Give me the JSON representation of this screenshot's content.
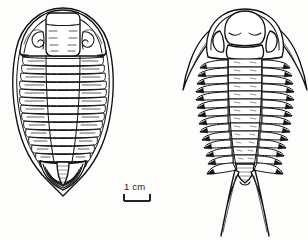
{
  "figure": {
    "kind": "scientific-line-drawing",
    "background_color": "#fdfdfc",
    "ink_color": "#1a1a1a",
    "width": 308,
    "height": 240
  },
  "scale_bar": {
    "label": "1 cm",
    "label_text": "1 cm",
    "bar_length_px": 26,
    "style": "bracket",
    "position": "center-bottom"
  },
  "specimens": [
    {
      "id": "left-specimen",
      "name": "smooth-trilobite",
      "position": "left",
      "outline": "ovate-teardrop",
      "cephalon": {
        "shape": "semicircular",
        "glabella": "elongate-subrectangular",
        "glabellar_furrows": 4,
        "eye_structure": "curved-palpebral-lobe",
        "genal_spines": "absent",
        "border_rim": "present"
      },
      "thorax": {
        "segment_count": 14,
        "pleural_tips": "rounded",
        "axial_lobe": "narrow-tapering"
      },
      "pygidium": {
        "shape": "triangular-pointed",
        "rib_count": 11,
        "terminal_spine": "absent",
        "border_rim": "present"
      }
    },
    {
      "id": "right-specimen",
      "name": "spiny-trilobite",
      "position": "right",
      "outline": "elongate-spinose",
      "cephalon": {
        "shape": "broad-arcuate",
        "glabella": "bulbous-inflated",
        "glabellar_furrows": 2,
        "eye_structure": "lateral-lobe",
        "genal_spines": "long-curved-paired",
        "border_rim": "present"
      },
      "thorax": {
        "segment_count": 13,
        "pleural_tips": "pointed-spinose",
        "axial_lobe": "broad-ringed",
        "axial_tubercles": "present"
      },
      "pygidium": {
        "shape": "small-tapering",
        "rib_count": 5,
        "terminal_spine": "paired-long-caudal",
        "caudal_spine_count": 2
      }
    }
  ]
}
